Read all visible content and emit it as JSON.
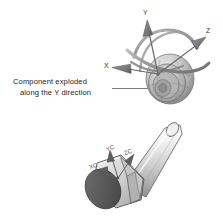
{
  "figure": {
    "kind": "cad-technical-illustration",
    "background_color": "#ffffff",
    "palette": {
      "outline": "#4a4a4a",
      "light_gray": "#e3e3e3",
      "mid_gray": "#b9b9b9",
      "dark_gray": "#6e6e6e",
      "darkest_gray": "#4d4d4d",
      "text": "#1d1d1d",
      "leader_line": "#555555"
    }
  },
  "annotation": {
    "line1": "Component exploded",
    "line2": "along the Y direction",
    "leader_line_label": "leader-line-to-triad"
  },
  "triad_global": {
    "name": "move-rotate-triad",
    "axes": [
      {
        "id": "y-axis",
        "label": "Y",
        "direction": "up"
      },
      {
        "id": "z-axis",
        "label": "Z",
        "direction": "upper-right"
      },
      {
        "id": "x-axis",
        "label": "X",
        "direction": "left"
      }
    ],
    "handles": [
      "rotation-arc-xy",
      "rotation-arc-yz",
      "rotation-arc-xz"
    ],
    "body": "spherical-exploded-assembly"
  },
  "triad_component": {
    "name": "component-csys-triad",
    "axes": [
      {
        "id": "yc-axis",
        "label": "YC"
      },
      {
        "id": "zc-axis",
        "label": "ZC"
      },
      {
        "id": "xc-axis",
        "label": "XC"
      }
    ],
    "body": "hex-head-bolt"
  }
}
